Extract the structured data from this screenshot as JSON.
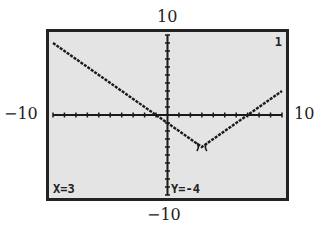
{
  "chart_data": {
    "type": "line",
    "title": "",
    "function": "y = |x - 3| - 4",
    "x": [
      -10,
      -5,
      0,
      3,
      5,
      10
    ],
    "series": [
      {
        "name": "Y1",
        "values": [
          9,
          4,
          -1,
          -4,
          -2,
          3
        ]
      }
    ],
    "xlim": [
      -10,
      10
    ],
    "ylim": [
      -10,
      10
    ],
    "window_labels": {
      "top": "10",
      "bottom": "-10",
      "left": "-10",
      "right": "10"
    },
    "grid": false,
    "trace_cursor": {
      "x": 3,
      "y": -4
    }
  },
  "labels": {
    "ymax": "10",
    "ymin": "−10",
    "xmin": "−10",
    "xmax": "10"
  },
  "screen": {
    "graph_number": "1",
    "trace_x": "X=3",
    "trace_y": "Y=-4"
  }
}
